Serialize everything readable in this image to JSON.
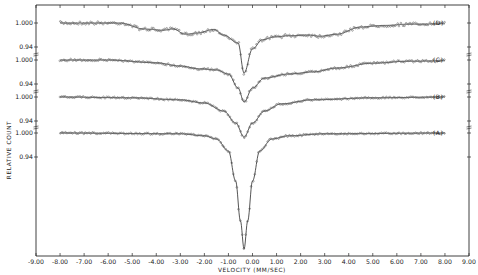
{
  "chart_data": {
    "type": "line",
    "title": "",
    "xlabel": "VELOCITY (MM/SEC)",
    "ylabel": "RELATIVE COUNT",
    "xlim": [
      -9.0,
      9.0
    ],
    "x_ticks": [
      "-9.00",
      "-8.00",
      "-7.00",
      "-6.00",
      "-5.00",
      "-4.00",
      "-3.00",
      "-2.00",
      "-1.00",
      "0.00",
      "1.00",
      "2.00",
      "3.00",
      "4.00",
      "5.00",
      "6.00",
      "7.00",
      "8.00",
      "9.00"
    ],
    "y_tick_labels": [
      "1.000",
      "0.94"
    ],
    "grid": false,
    "legend_position": "right (inline labels)",
    "data_range_x": [
      -8.0,
      8.0
    ],
    "series": [
      {
        "name": "(D)",
        "label": "(D)",
        "baseline": 1.0,
        "description": "Broad magnetic hyperfine-like spectrum with sloping wings and central dip",
        "min_relative_count": 0.875,
        "min_velocity": -0.35,
        "profile_points": [
          [
            -8.0,
            1.0
          ],
          [
            -5.5,
            1.0
          ],
          [
            -4.5,
            0.985
          ],
          [
            -3.7,
            0.982
          ],
          [
            -3.3,
            0.985
          ],
          [
            -2.8,
            0.972
          ],
          [
            -2.3,
            0.975
          ],
          [
            -1.6,
            0.984
          ],
          [
            -1.2,
            0.97
          ],
          [
            -0.6,
            0.95
          ],
          [
            -0.35,
            0.875
          ],
          [
            0.0,
            0.935
          ],
          [
            0.4,
            0.958
          ],
          [
            0.9,
            0.965
          ],
          [
            1.5,
            0.968
          ],
          [
            2.3,
            0.97
          ],
          [
            2.8,
            0.967
          ],
          [
            3.5,
            0.972
          ],
          [
            4.5,
            0.99
          ],
          [
            5.5,
            0.994
          ],
          [
            6.5,
            0.997
          ],
          [
            8.0,
            0.998
          ]
        ]
      },
      {
        "name": "(C)",
        "label": "(C)",
        "baseline": 1.0,
        "description": "Broadened central absorption with asymmetric shoulders",
        "min_relative_count": 0.895,
        "min_velocity": -0.35,
        "profile_points": [
          [
            -8.0,
            1.0
          ],
          [
            -6.0,
            1.0
          ],
          [
            -4.0,
            0.993
          ],
          [
            -3.0,
            0.985
          ],
          [
            -2.2,
            0.978
          ],
          [
            -1.5,
            0.975
          ],
          [
            -1.0,
            0.965
          ],
          [
            -0.6,
            0.93
          ],
          [
            -0.35,
            0.895
          ],
          [
            0.0,
            0.93
          ],
          [
            0.5,
            0.955
          ],
          [
            1.5,
            0.965
          ],
          [
            2.5,
            0.97
          ],
          [
            3.5,
            0.98
          ],
          [
            5.0,
            0.992
          ],
          [
            6.5,
            0.997
          ],
          [
            8.0,
            0.998
          ]
        ]
      },
      {
        "name": "(B)",
        "label": "(B)",
        "baseline": 1.0,
        "description": "Single absorption line with broad wings",
        "min_relative_count": 0.9,
        "min_velocity": -0.35,
        "profile_points": [
          [
            -8.0,
            1.0
          ],
          [
            -5.0,
            0.998
          ],
          [
            -3.0,
            0.993
          ],
          [
            -2.0,
            0.985
          ],
          [
            -1.2,
            0.965
          ],
          [
            -0.7,
            0.935
          ],
          [
            -0.35,
            0.9
          ],
          [
            0.0,
            0.935
          ],
          [
            0.5,
            0.965
          ],
          [
            1.2,
            0.983
          ],
          [
            2.5,
            0.993
          ],
          [
            5.0,
            0.998
          ],
          [
            8.0,
            1.0
          ]
        ]
      },
      {
        "name": "(A)",
        "label": "(A)",
        "baseline": 1.0,
        "description": "Deep narrow single Lorentzian absorption line",
        "min_relative_count": 0.71,
        "min_velocity": -0.35,
        "profile_points": [
          [
            -8.0,
            1.0
          ],
          [
            -3.0,
            0.998
          ],
          [
            -2.0,
            0.993
          ],
          [
            -1.5,
            0.985
          ],
          [
            -1.0,
            0.955
          ],
          [
            -0.7,
            0.88
          ],
          [
            -0.5,
            0.78
          ],
          [
            -0.35,
            0.71
          ],
          [
            -0.2,
            0.78
          ],
          [
            0.0,
            0.88
          ],
          [
            0.3,
            0.955
          ],
          [
            0.8,
            0.985
          ],
          [
            1.5,
            0.993
          ],
          [
            3.0,
            0.998
          ],
          [
            8.0,
            1.0
          ]
        ]
      }
    ]
  },
  "layout": {
    "plot": {
      "left": 36,
      "right": 469,
      "top": 5,
      "bottom": 256
    },
    "offsets_px": {
      "D": 23,
      "C": 60,
      "B": 97,
      "A": 133
    },
    "px_per_unit_count": 400,
    "line_color": "#2a2a2a",
    "marker_color": "#555555"
  }
}
